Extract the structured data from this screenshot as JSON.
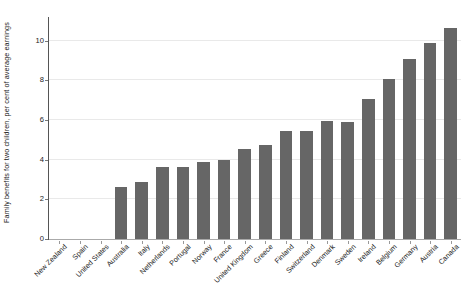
{
  "chart_data": {
    "type": "bar",
    "title": "",
    "subtitle": "",
    "xlabel": "",
    "ylabel": "Family benefits for two children, per cent of average earnings",
    "ylim": [
      0,
      11.2
    ],
    "yticks": [
      0,
      2,
      4,
      6,
      8,
      10
    ],
    "ytick_labels": [
      "0",
      "2",
      "4",
      "6",
      "8",
      "10"
    ],
    "grid": true,
    "legend": "none",
    "bar_color": "#666666",
    "categories": [
      "New Zealand",
      "Spain",
      "United States",
      "Australia",
      "Italy",
      "Netherlands",
      "Portugal",
      "Norway",
      "France",
      "United Kingdom",
      "Greece",
      "Finland",
      "Switzerland",
      "Denmark",
      "Sweden",
      "Ireland",
      "Belgium",
      "Germany",
      "Austria",
      "Canada"
    ],
    "values": [
      0,
      0,
      0,
      2.6,
      2.9,
      3.65,
      3.65,
      3.9,
      4.0,
      4.55,
      4.75,
      5.45,
      5.45,
      5.95,
      5.9,
      7.05,
      8.05,
      9.1,
      9.9,
      10.65
    ]
  }
}
